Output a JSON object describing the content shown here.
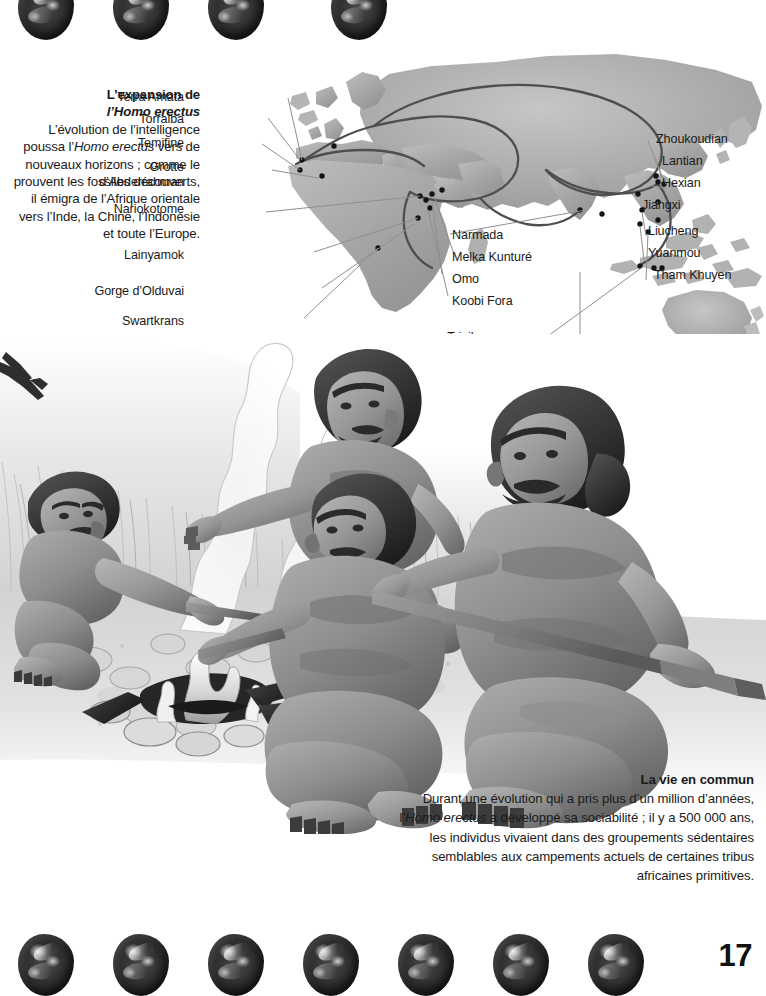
{
  "page": {
    "folio": "17",
    "background_color": "#ffffff",
    "text_color": "#1a1a1a"
  },
  "intro": {
    "title_line1": "L’expansion de",
    "title_line2": "l’Homo erectus",
    "title_italic_part": "Homo erectus",
    "body": "L’évolution de l’intelligence poussa l’Homo erectus vers de nouveaux horizons ; comme le prouvent les fossiles découverts, il émigra de l’Afrique orientale vers l’Inde, la Chine, l’Indonésie et toute l’Europe.",
    "body_before_italic": "L’évolution de l’intelligence poussa l’",
    "body_italic": "Homo erectus",
    "body_after_italic": " vers de nouveaux horizons ; comme le prouvent les fossiles découverts, il émigra de l’Afrique orientale vers l’Inde, la Chine, l’Indonésie et toute l’Europe."
  },
  "map": {
    "land_color": "#a9a9a9",
    "route_color": "#4a4a4a",
    "site_dot_color": "#141414",
    "leader_line_color": "#8c8c8c",
    "labels_left": [
      {
        "id": "terra-amata",
        "text": "Terra Amata"
      },
      {
        "id": "torralba",
        "text": "Torralba"
      },
      {
        "id": "temifine",
        "text": "Temifine"
      },
      {
        "id": "grotte-abderrahman",
        "text": "Grotte d’Abderrahman",
        "line1": "Grotte",
        "line2": "d’Abderrahman"
      },
      {
        "id": "nariokotome",
        "text": "Nariokotome"
      },
      {
        "id": "lainyamok",
        "text": "Lainyamok"
      },
      {
        "id": "gorge-olduvai",
        "text": "Gorge d’Olduvai"
      },
      {
        "id": "swartkrans",
        "text": "Swartkrans"
      }
    ],
    "labels_center": [
      {
        "id": "narmada",
        "text": "Narmada"
      },
      {
        "id": "melka-kunture",
        "text": "Melka Kunturé"
      },
      {
        "id": "omo",
        "text": "Omo"
      },
      {
        "id": "koobi-fora",
        "text": "Koobi Fora"
      },
      {
        "id": "trinil-sambungmachan-sangiran",
        "text": "Trinil, Sambungmachan et Sangiran",
        "line1": "Trinil,",
        "line2": "Sambungmachan",
        "line3": "et Sangiran"
      },
      {
        "id": "peming",
        "text": "Peming"
      }
    ],
    "labels_right": [
      {
        "id": "zhoukoudian",
        "text": "Zhoukoudian"
      },
      {
        "id": "lantian",
        "text": "Lantian"
      },
      {
        "id": "hexian",
        "text": "Hexian"
      },
      {
        "id": "jiangxi",
        "text": "Jiangxi"
      },
      {
        "id": "liucheng",
        "text": "Liucheng"
      },
      {
        "id": "yuanmou",
        "text": "Yuanmou"
      },
      {
        "id": "tham-khuyen",
        "text": "Tham Khuyen"
      }
    ]
  },
  "illustration": {
    "description": "Groupe d’Homo erectus autour d’un feu de camp",
    "figure_count": 4
  },
  "caption": {
    "title": "La vie en commun",
    "body": "Durant une évolution qui a pris plus d’un million d’années, l’Homo erectus a développé sa sociabilité ; il y a 500 000 ans, les individus vivaient dans des groupements sédentaires semblables aux campements actuels de certaines tribus africaines primitives.",
    "body_before_italic": "Durant une évolution qui a pris plus d’un million d’années, l’",
    "body_italic": "Homo erectus",
    "body_after_italic": " a développé sa sociabilité ; il y a 500 000 ans, les individus vivaient dans des groupements sédentaires semblables aux campements actuels de certaines tribus africaines primitives."
  },
  "decoration": {
    "stone_icon_name": "flint-stone-icon",
    "top_row_count": 4,
    "bottom_row_count": 7,
    "top_row_x": [
      10,
      110,
      210,
      310
    ],
    "bottom_row_x": [
      10,
      110,
      210,
      310,
      410,
      510,
      610
    ]
  }
}
